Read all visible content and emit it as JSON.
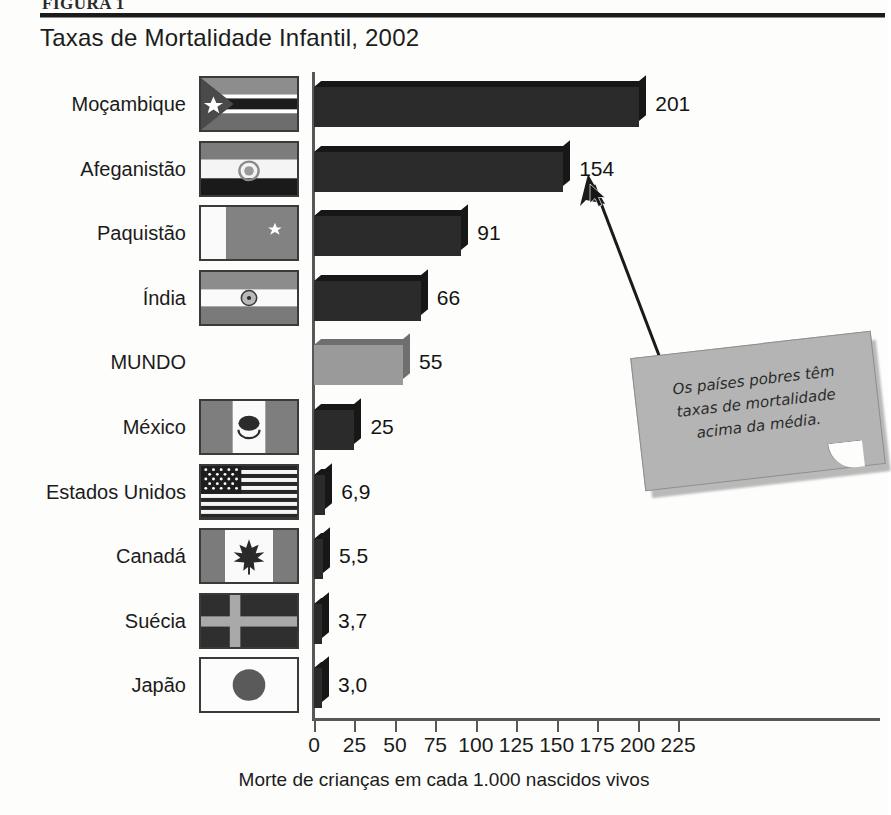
{
  "header": {
    "kicker": "FIGURA 1",
    "title": "Taxas de Mortalidade Infantil, 2002"
  },
  "chart_data": {
    "type": "bar",
    "orientation": "horizontal",
    "title": "Taxas de Mortalidade Infantil, 2002",
    "xlabel": "Morte de crianças em cada 1.000 nascidos vivos",
    "ylabel": "",
    "xlim": [
      0,
      225
    ],
    "xticks": [
      0,
      25,
      50,
      75,
      100,
      125,
      150,
      175,
      200,
      225
    ],
    "xtick_labels": [
      "0",
      "25",
      "50",
      "75",
      "100",
      "125",
      "150",
      "175",
      "200",
      "225"
    ],
    "grid": false,
    "legend": "none",
    "categories": [
      "Moçambique",
      "Afeganistão",
      "Paquistão",
      "Índia",
      "MUNDO",
      "México",
      "Estados Unidos",
      "Canadá",
      "Suécia",
      "Japão"
    ],
    "values": [
      201,
      154,
      91,
      66,
      55,
      25,
      6.9,
      5.5,
      3.7,
      3.0
    ],
    "value_labels": [
      "201",
      "154",
      "91",
      "66",
      "55",
      "25",
      "6,9",
      "5,5",
      "3,7",
      "3,0"
    ],
    "highlight_category": "MUNDO",
    "bar_color": "#2b2b2b",
    "highlight_color": "#9a9a9a"
  },
  "rows": [
    {
      "label": "Moçambique",
      "value_label": "201",
      "value": 201,
      "flag": "flag-mozambique",
      "highlight": false
    },
    {
      "label": "Afeganistão",
      "value_label": "154",
      "value": 154,
      "flag": "flag-afghanistan",
      "highlight": false
    },
    {
      "label": "Paquistão",
      "value_label": "91",
      "value": 91,
      "flag": "flag-pakistan",
      "highlight": false
    },
    {
      "label": "Índia",
      "value_label": "66",
      "value": 66,
      "flag": "flag-india",
      "highlight": false
    },
    {
      "label": "MUNDO",
      "value_label": "55",
      "value": 55,
      "flag": null,
      "highlight": true
    },
    {
      "label": "México",
      "value_label": "25",
      "value": 25,
      "flag": "flag-mexico",
      "highlight": false
    },
    {
      "label": "Estados Unidos",
      "value_label": "6,9",
      "value": 6.9,
      "flag": "flag-united-states",
      "highlight": false
    },
    {
      "label": "Canadá",
      "value_label": "5,5",
      "value": 5.5,
      "flag": "flag-canada",
      "highlight": false
    },
    {
      "label": "Suécia",
      "value_label": "3,7",
      "value": 3.7,
      "flag": "flag-sweden",
      "highlight": false
    },
    {
      "label": "Japão",
      "value_label": "3,0",
      "value": 3.0,
      "flag": "flag-japan",
      "highlight": false
    }
  ],
  "axis": {
    "caption": "Morte de crianças em cada 1.000 nascidos vivos",
    "ticks": [
      "0",
      "25",
      "50",
      "75",
      "100",
      "125",
      "150",
      "175",
      "200",
      "225"
    ]
  },
  "note": {
    "line1": "Os países pobres têm",
    "line2": "taxas de mortalidade",
    "line3": "acima da média.",
    "points_to": "Afeganistão"
  },
  "colors": {
    "bar": "#2b2b2b",
    "bar_highlight": "#9a9a9a",
    "axis": "#58585a",
    "note_paper": "#b4b4b4",
    "page_background": "#fdfdfb"
  }
}
